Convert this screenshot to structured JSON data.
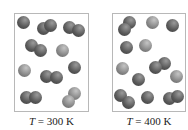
{
  "panels": [
    {
      "id": "left",
      "temperature_symbol": "T",
      "equals": "=",
      "temperature_value": "300 K",
      "box": {
        "x": 14,
        "y": 13,
        "w": 75,
        "h": 99
      },
      "sphere_radius": 6.5,
      "molecules": [
        {
          "atoms": [
            [
              23,
              22
            ]
          ],
          "shade": "dark"
        },
        {
          "atoms": [
            [
              43,
              28
            ],
            [
              50,
              25
            ]
          ],
          "shade": "dark"
        },
        {
          "atoms": [
            [
              69,
              27
            ],
            [
              78,
              30
            ]
          ],
          "shade": "dark"
        },
        {
          "atoms": [
            [
              31,
              45
            ],
            [
              40,
              50
            ]
          ],
          "shade": "dark"
        },
        {
          "atoms": [
            [
              62,
              50
            ]
          ],
          "shade": "light"
        },
        {
          "atoms": [
            [
              24,
              70
            ]
          ],
          "shade": "light"
        },
        {
          "atoms": [
            [
              46,
              76
            ],
            [
              56,
              77
            ]
          ],
          "shade": "dark"
        },
        {
          "atoms": [
            [
              74,
              67
            ]
          ],
          "shade": "dark"
        },
        {
          "atoms": [
            [
              26,
              97
            ],
            [
              35,
              97
            ]
          ],
          "shade": "dark"
        },
        {
          "atoms": [
            [
              74,
              93
            ],
            [
              68,
              101
            ]
          ],
          "shade": "light"
        }
      ]
    },
    {
      "id": "right",
      "temperature_symbol": "T",
      "equals": "=",
      "temperature_value": "400 K",
      "box": {
        "x": 112,
        "y": 13,
        "w": 74,
        "h": 99
      },
      "sphere_radius": 6.5,
      "molecules": [
        {
          "atoms": [
            [
              129,
              22
            ],
            [
              124,
              29
            ]
          ],
          "shade": "dark"
        },
        {
          "atoms": [
            [
              152,
              22
            ]
          ],
          "shade": "light"
        },
        {
          "atoms": [
            [
              172,
              25
            ]
          ],
          "shade": "dark"
        },
        {
          "atoms": [
            [
              126,
              47
            ]
          ],
          "shade": "dark"
        },
        {
          "atoms": [
            [
              145,
              45
            ]
          ],
          "shade": "light"
        },
        {
          "atoms": [
            [
              122,
              68
            ]
          ],
          "shade": "light"
        },
        {
          "atoms": [
            [
              164,
              63
            ],
            [
              155,
              67
            ]
          ],
          "shade": "dark"
        },
        {
          "atoms": [
            [
              138,
              79
            ]
          ],
          "shade": "dark"
        },
        {
          "atoms": [
            [
              176,
              76
            ]
          ],
          "shade": "light"
        },
        {
          "atoms": [
            [
              120,
              95
            ],
            [
              128,
              102
            ]
          ],
          "shade": "dark"
        },
        {
          "atoms": [
            [
              147,
              97
            ]
          ],
          "shade": "dark"
        },
        {
          "atoms": [
            [
              169,
              98
            ],
            [
              177,
              96
            ]
          ],
          "shade": "dark"
        }
      ]
    }
  ],
  "colors": {
    "dark": [
      "#9a9a9a",
      "#5a5a5a",
      "#3a3a3a"
    ],
    "light": [
      "#c4c4c4",
      "#8a8a8a",
      "#5e5e5e"
    ],
    "border": "#b8b8b8"
  }
}
